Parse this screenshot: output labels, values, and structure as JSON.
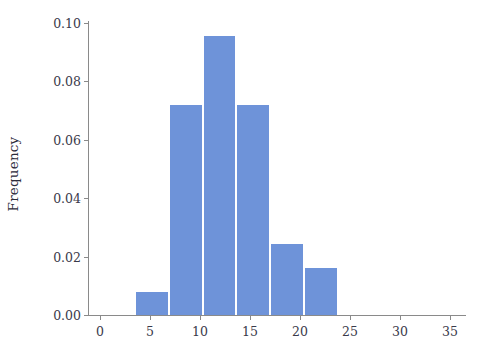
{
  "chart_data": {
    "type": "bar",
    "title": "",
    "xlabel": "",
    "ylabel": "Frequency",
    "xlim": [
      -1.2,
      36.5
    ],
    "ylim": [
      0.0,
      0.1
    ],
    "grid": false,
    "legend": null,
    "bar_color": "#6e93d9",
    "axis_color": "#8a8a8a",
    "tick_text_color": "#3a3a4a",
    "bin_edges": [
      3.6,
      7.0,
      10.4,
      13.7,
      17.1,
      20.5,
      23.9
    ],
    "bin_width": 3.4,
    "categories": [
      "3.6-7.0",
      "7.0-10.4",
      "10.4-13.7",
      "13.7-17.1",
      "17.1-20.5",
      "20.5-23.9"
    ],
    "values": [
      0.008,
      0.072,
      0.0955,
      0.0718,
      0.0242,
      0.0162
    ],
    "xticks": [
      {
        "value": 0,
        "label": "0"
      },
      {
        "value": 5,
        "label": "5"
      },
      {
        "value": 10,
        "label": "10"
      },
      {
        "value": 15,
        "label": "15"
      },
      {
        "value": 20,
        "label": "20"
      },
      {
        "value": 25,
        "label": "25"
      },
      {
        "value": 30,
        "label": "30"
      },
      {
        "value": 35,
        "label": "35"
      }
    ],
    "yticks": [
      {
        "value": 0.0,
        "label": "0.00"
      },
      {
        "value": 0.02,
        "label": "0.02"
      },
      {
        "value": 0.04,
        "label": "0.04"
      },
      {
        "value": 0.06,
        "label": "0.06"
      },
      {
        "value": 0.08,
        "label": "0.08"
      },
      {
        "value": 0.1,
        "label": "0.10"
      }
    ]
  }
}
